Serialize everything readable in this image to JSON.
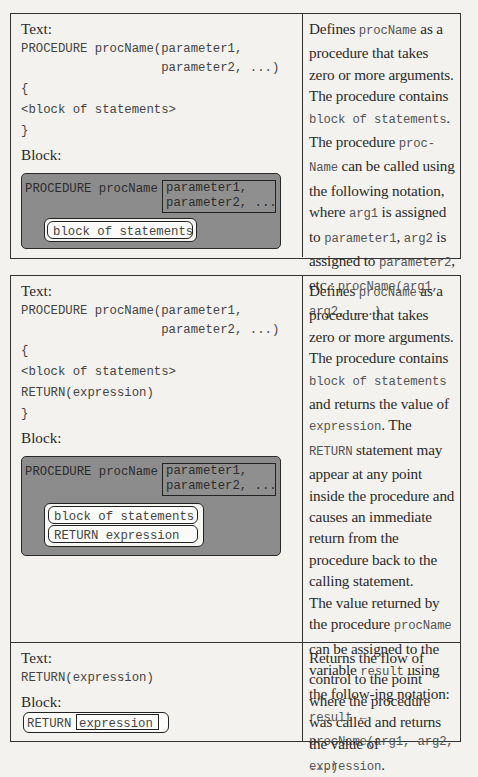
{
  "tables": [
    {
      "rows": [
        {
          "text_label": "Text:",
          "code_lines": [
            "PROCEDURE procName(parameter1,",
            "                   parameter2, ...)",
            "{",
            "<block of statements>",
            "}"
          ],
          "block_label": "Block:",
          "block": {
            "keyword": "PROCEDURE procName",
            "params": [
              "parameter1,",
              "parameter2, ..."
            ],
            "statements": [
              "block of statements"
            ]
          },
          "description": [
            {
              "t": "Defines "
            },
            {
              "c": "procName"
            },
            {
              "t": " as a procedure that takes zero or more arguments. The procedure contains "
            },
            {
              "c": "block of statements"
            },
            {
              "t": "."
            },
            {
              "br": true
            },
            {
              "t": "The procedure "
            },
            {
              "c": "proc-Name"
            },
            {
              "t": " can be called using the following notation, where "
            },
            {
              "c": "arg1"
            },
            {
              "t": " is assigned to "
            },
            {
              "c": "parameter1"
            },
            {
              "t": ", "
            },
            {
              "c": "arg2"
            },
            {
              "t": " is assigned to "
            },
            {
              "c": "parameter2"
            },
            {
              "t": ", etc.: "
            },
            {
              "c": "procName(arg1, arg2, ...)"
            }
          ]
        }
      ]
    },
    {
      "rows": [
        {
          "text_label": "Text:",
          "code_lines": [
            "PROCEDURE procName(parameter1,",
            "                   parameter2, ...)",
            "{",
            "<block of statements>",
            "RETURN(expression)",
            "}"
          ],
          "block_label": "Block:",
          "block": {
            "keyword": "PROCEDURE procName",
            "params": [
              "parameter1,",
              "parameter2, ..."
            ],
            "statements": [
              "block of statements",
              "RETURN expression"
            ]
          },
          "description": [
            {
              "t": "Defines "
            },
            {
              "c": "procName"
            },
            {
              "t": " as a procedure that takes zero or more arguments. The procedure contains "
            },
            {
              "c": "block of statements"
            },
            {
              "t": " and returns the value of "
            },
            {
              "c": "expression"
            },
            {
              "t": ". The "
            },
            {
              "c": "RETURN"
            },
            {
              "t": " statement may appear at any point inside the procedure and causes an immediate return from the procedure back to the calling statement."
            },
            {
              "br": true
            },
            {
              "t": "The value returned by the procedure "
            },
            {
              "c": "procName"
            },
            {
              "t": " can be assigned to the variable "
            },
            {
              "c": "result"
            },
            {
              "t": " using the follow-ing notation: "
            },
            {
              "c": "result ← procName(arg1, arg2, ...)"
            }
          ]
        },
        {
          "text_label": "Text:",
          "code_lines": [
            "RETURN(expression)"
          ],
          "block_label": "Block:",
          "block": {
            "keyword": "RETURN",
            "params": [
              "expression"
            ]
          },
          "description": [
            {
              "t": "Returns the flow of control to the point where the procedure was called and returns the value of "
            },
            {
              "c": "expression"
            },
            {
              "t": "."
            }
          ]
        }
      ]
    }
  ]
}
